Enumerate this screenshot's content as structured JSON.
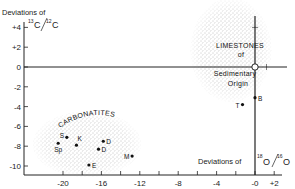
{
  "chart_data": {
    "type": "scatter",
    "title": "",
    "xlabel": {
      "prefix": "Deviations of",
      "isotope_top": "18",
      "element_top": "O",
      "isotope_bottom": "16",
      "element_bottom": "O"
    },
    "ylabel": {
      "prefix": "Deviations of",
      "isotope_top": "13",
      "element_top": "C",
      "isotope_bottom": "12",
      "element_bottom": "C"
    },
    "xlim": [
      -22,
      3
    ],
    "ylim": [
      -11,
      5
    ],
    "x_ticks": [
      {
        "value": -20,
        "label": "-20"
      },
      {
        "value": -16,
        "label": "-16"
      },
      {
        "value": -12,
        "label": "-12"
      },
      {
        "value": -8,
        "label": "-8"
      },
      {
        "value": -4,
        "label": "-4"
      },
      {
        "value": 0,
        "label": "-0"
      },
      {
        "value": 2,
        "label": "+2"
      }
    ],
    "x_minor_ticks": [
      -18,
      -14,
      -10,
      -6,
      -2
    ],
    "y_ticks": [
      {
        "value": 4,
        "label": "+4"
      },
      {
        "value": 2,
        "label": "+2"
      },
      {
        "value": 0,
        "label": "0"
      },
      {
        "value": -2,
        "label": "-2"
      },
      {
        "value": -4,
        "label": "-4"
      },
      {
        "value": -6,
        "label": "-6"
      },
      {
        "value": -8,
        "label": "-8"
      },
      {
        "value": -10,
        "label": "-10"
      }
    ],
    "regions": [
      {
        "name": "limestones",
        "label_lines": [
          "LIMESTONES",
          "of",
          "Sedimentary",
          "Origin"
        ],
        "center": [
          -2.5,
          1.7
        ],
        "radius": [
          4.2,
          5.2
        ]
      },
      {
        "name": "carbonatites",
        "label_lines": [
          "CARBONATITES"
        ],
        "center": [
          -17.5,
          -7.8
        ],
        "radius": [
          5.6,
          3.3
        ]
      }
    ],
    "reference_point": {
      "x": 0,
      "y": 0,
      "marker": "open-circle"
    },
    "series": [
      {
        "name": "Samples",
        "points": [
          {
            "label": "S",
            "x": -19.6,
            "y": -7.1
          },
          {
            "label": "Sp",
            "x": -20.5,
            "y": -7.7
          },
          {
            "label": "K",
            "x": -18.6,
            "y": -7.9
          },
          {
            "label": "D",
            "x": -15.8,
            "y": -7.5
          },
          {
            "label": "D",
            "x": -16.3,
            "y": -8.3
          },
          {
            "label": "M",
            "x": -12.8,
            "y": -9.0
          },
          {
            "label": "E",
            "x": -17.3,
            "y": -9.9
          },
          {
            "label": "B",
            "x": 0.0,
            "y": -3.1
          },
          {
            "label": "T",
            "x": -1.3,
            "y": -3.8
          }
        ]
      }
    ],
    "grid": false,
    "legend": "none"
  }
}
